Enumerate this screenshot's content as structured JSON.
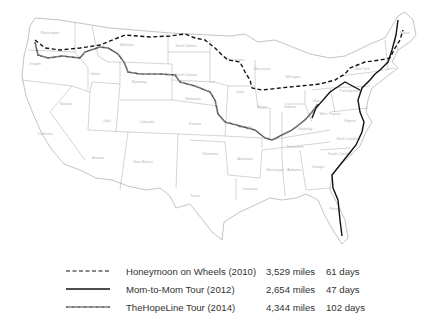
{
  "map": {
    "region": "Contiguous United States",
    "state_labels": [
      {
        "name": "Washington",
        "x": 50,
        "y": 34
      },
      {
        "name": "Oregon",
        "x": 35,
        "y": 65
      },
      {
        "name": "California",
        "x": 45,
        "y": 135
      },
      {
        "name": "Nevada",
        "x": 66,
        "y": 105
      },
      {
        "name": "Idaho",
        "x": 95,
        "y": 75
      },
      {
        "name": "Montana",
        "x": 127,
        "y": 46
      },
      {
        "name": "Wyoming",
        "x": 139,
        "y": 83
      },
      {
        "name": "Utah",
        "x": 107,
        "y": 122
      },
      {
        "name": "Colorado",
        "x": 147,
        "y": 123
      },
      {
        "name": "Arizona",
        "x": 98,
        "y": 159
      },
      {
        "name": "New Mexico",
        "x": 143,
        "y": 163
      },
      {
        "name": "North Dakota",
        "x": 186,
        "y": 47
      },
      {
        "name": "South Dakota",
        "x": 186,
        "y": 76
      },
      {
        "name": "Nebraska",
        "x": 193,
        "y": 100
      },
      {
        "name": "Kansas",
        "x": 195,
        "y": 125
      },
      {
        "name": "Oklahoma",
        "x": 210,
        "y": 155
      },
      {
        "name": "Texas",
        "x": 195,
        "y": 197
      },
      {
        "name": "Minnesota",
        "x": 236,
        "y": 61
      },
      {
        "name": "Iowa",
        "x": 240,
        "y": 93
      },
      {
        "name": "Missouri",
        "x": 245,
        "y": 128
      },
      {
        "name": "Arkansas",
        "x": 245,
        "y": 160
      },
      {
        "name": "Louisiana",
        "x": 250,
        "y": 190
      },
      {
        "name": "Wisconsin",
        "x": 262,
        "y": 70
      },
      {
        "name": "Illinois",
        "x": 262,
        "y": 108
      },
      {
        "name": "Michigan",
        "x": 293,
        "y": 78
      },
      {
        "name": "Indiana",
        "x": 290,
        "y": 108
      },
      {
        "name": "Ohio",
        "x": 316,
        "y": 102
      },
      {
        "name": "Kentucky",
        "x": 305,
        "y": 130
      },
      {
        "name": "Tennessee",
        "x": 295,
        "y": 148
      },
      {
        "name": "Mississippi",
        "x": 275,
        "y": 171
      },
      {
        "name": "Alabama",
        "x": 294,
        "y": 171
      },
      {
        "name": "Georgia",
        "x": 318,
        "y": 168
      },
      {
        "name": "Florida",
        "x": 335,
        "y": 210
      },
      {
        "name": "South Carolina",
        "x": 340,
        "y": 155
      },
      {
        "name": "North Carolina",
        "x": 348,
        "y": 140
      },
      {
        "name": "Virginia",
        "x": 350,
        "y": 122
      },
      {
        "name": "West Virginia",
        "x": 330,
        "y": 115
      },
      {
        "name": "Pennsylvania",
        "x": 350,
        "y": 92
      },
      {
        "name": "New York",
        "x": 362,
        "y": 70
      },
      {
        "name": "Maine",
        "x": 405,
        "y": 34
      }
    ]
  },
  "legend": {
    "items": [
      {
        "style": "dashed",
        "name": "Honeymoon on Wheels (2010)",
        "miles": "3,529 miles",
        "days": "61 days"
      },
      {
        "style": "solid",
        "name": "Mom-to-Mom Tour (2012)",
        "miles": "2,654 miles",
        "days": "47 days"
      },
      {
        "style": "dotted",
        "name": "TheHopeLine Tour (2014)",
        "miles": "4,344 miles",
        "days": "102 days"
      }
    ]
  }
}
